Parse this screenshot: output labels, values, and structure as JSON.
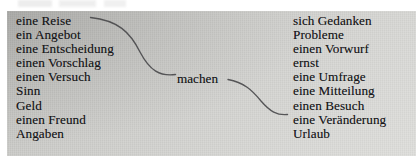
{
  "figure": {
    "type": "collocation-diagram",
    "verb": "machen",
    "left_column": [
      "eine Reise",
      "ein Angebot",
      "eine Entscheidung",
      "einen Vorschlag",
      "einen Versuch",
      "Sinn",
      "Geld",
      "einen Freund",
      "Angaben"
    ],
    "right_column": [
      "sich Gedanken",
      "Probleme",
      "einen Vorwurf",
      "ernst",
      "eine Umfrage",
      "eine Mitteilung",
      "einen Besuch",
      "eine Veränderung",
      "Urlaub"
    ],
    "colors": {
      "panel_top_left": "#c0c0bd",
      "panel_bottom_right": "#dedeDB",
      "text": "#17171a",
      "connector_line": "#4a4a4c",
      "page_background": "#ffffff"
    }
  }
}
